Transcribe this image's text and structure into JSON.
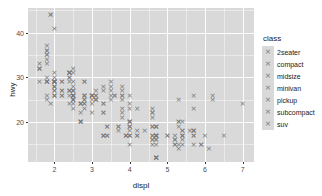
{
  "chart_data": {
    "type": "scatter",
    "title": "",
    "xlabel": "displ",
    "ylabel": "hwy",
    "xlim": [
      1.3,
      7.3
    ],
    "ylim": [
      11,
      45.5
    ],
    "xticks": [
      2,
      3,
      4,
      5,
      6,
      7
    ],
    "yticks": [
      20,
      30,
      40
    ],
    "xtick_labels": [
      "2",
      "3",
      "4",
      "5",
      "6",
      "7"
    ],
    "ytick_labels": [
      "20",
      "30",
      "40"
    ],
    "x_minor_ticks": [
      1.5,
      2.5,
      3.5,
      4.5,
      5.5,
      6.5
    ],
    "y_minor_ticks": [
      15,
      25,
      35,
      45
    ],
    "grid": true,
    "panel_background": "#d9d9d9",
    "grid_color": "#ffffff",
    "point_color": "#777777",
    "point_shape": "cross",
    "legend": {
      "title": "class",
      "position": "right",
      "entries": [
        {
          "label": "2seater"
        },
        {
          "label": "compact"
        },
        {
          "label": "midsize"
        },
        {
          "label": "minivan"
        },
        {
          "label": "pickup"
        },
        {
          "label": "subcompact"
        },
        {
          "label": "suv"
        }
      ]
    },
    "x": [
      1.8,
      1.8,
      2.0,
      2.0,
      2.8,
      2.8,
      3.1,
      1.8,
      1.8,
      2.0,
      2.0,
      2.8,
      2.8,
      3.1,
      3.1,
      2.8,
      3.1,
      4.2,
      5.3,
      5.3,
      5.3,
      5.7,
      6.0,
      5.7,
      5.7,
      6.2,
      6.2,
      7.0,
      5.3,
      5.3,
      5.7,
      6.5,
      2.4,
      2.4,
      3.1,
      3.5,
      3.6,
      2.4,
      3.0,
      3.3,
      3.3,
      3.3,
      3.3,
      3.3,
      3.8,
      3.8,
      3.8,
      4.0,
      3.7,
      3.7,
      3.9,
      3.9,
      4.7,
      4.7,
      4.7,
      5.2,
      5.2,
      3.9,
      4.7,
      4.7,
      4.7,
      5.2,
      5.7,
      5.9,
      4.7,
      4.7,
      4.7,
      4.7,
      4.7,
      4.7,
      5.2,
      5.2,
      5.7,
      5.9,
      4.6,
      5.4,
      5.4,
      4.0,
      4.0,
      4.0,
      4.0,
      4.6,
      5.0,
      4.2,
      4.2,
      4.6,
      4.6,
      4.6,
      5.4,
      5.4,
      3.8,
      3.8,
      4.0,
      4.0,
      4.6,
      4.6,
      4.6,
      4.6,
      5.4,
      1.6,
      1.6,
      1.6,
      1.6,
      1.6,
      1.8,
      1.8,
      1.8,
      2.0,
      2.4,
      2.4,
      2.4,
      2.4,
      2.5,
      2.5,
      3.3,
      2.0,
      2.0,
      2.0,
      2.0,
      2.7,
      2.7,
      2.7,
      3.0,
      3.7,
      4.0,
      4.7,
      4.7,
      4.7,
      5.7,
      6.1,
      4.0,
      4.2,
      4.4,
      4.6,
      5.4,
      5.4,
      5.4,
      4.0,
      4.0,
      4.6,
      5.0,
      2.4,
      2.4,
      2.5,
      2.5,
      3.5,
      3.5,
      3.0,
      3.0,
      3.5,
      3.3,
      3.3,
      4.0,
      5.6,
      3.1,
      3.8,
      3.8,
      3.8,
      5.3,
      2.5,
      2.5,
      2.5,
      2.5,
      2.5,
      2.5,
      2.2,
      2.2,
      2.5,
      2.5,
      2.5,
      2.5,
      2.5,
      2.5,
      2.7,
      2.7,
      3.4,
      3.4,
      4.0,
      4.7,
      2.2,
      2.2,
      2.4,
      2.4,
      3.0,
      3.0,
      3.5,
      2.2,
      2.2,
      2.4,
      2.4,
      3.0,
      3.0,
      3.3,
      1.8,
      1.8,
      1.8,
      1.8,
      1.8,
      4.7,
      5.7,
      2.7,
      2.7,
      2.7,
      3.4,
      3.4,
      4.0,
      4.0,
      2.0,
      2.0,
      2.0,
      2.0,
      2.8,
      1.9,
      2.0,
      2.0,
      2.0,
      2.5,
      2.8,
      2.8,
      1.9,
      1.9,
      2.0,
      2.0,
      2.5,
      2.5,
      1.8,
      1.8,
      2.0,
      2.0,
      2.8,
      2.8,
      3.6
    ],
    "y": [
      29,
      29,
      31,
      30,
      26,
      26,
      27,
      26,
      25,
      28,
      27,
      25,
      25,
      25,
      25,
      24,
      25,
      23,
      20,
      15,
      20,
      17,
      17,
      26,
      23,
      26,
      25,
      24,
      19,
      14,
      15,
      17,
      27,
      30,
      26,
      29,
      26,
      24,
      24,
      22,
      22,
      24,
      24,
      17,
      22,
      21,
      23,
      23,
      19,
      18,
      17,
      17,
      19,
      19,
      12,
      17,
      15,
      17,
      17,
      12,
      17,
      16,
      18,
      15,
      16,
      12,
      17,
      17,
      16,
      12,
      15,
      16,
      17,
      15,
      17,
      17,
      18,
      17,
      19,
      17,
      19,
      19,
      17,
      17,
      17,
      16,
      16,
      17,
      15,
      17,
      26,
      25,
      26,
      24,
      21,
      22,
      23,
      22,
      20,
      33,
      32,
      32,
      29,
      32,
      34,
      36,
      36,
      29,
      26,
      27,
      30,
      31,
      26,
      26,
      28,
      26,
      29,
      28,
      27,
      24,
      24,
      24,
      22,
      19,
      20,
      17,
      12,
      19,
      18,
      14,
      15,
      18,
      18,
      15,
      17,
      16,
      18,
      17,
      19,
      19,
      17,
      29,
      27,
      31,
      32,
      27,
      26,
      26,
      25,
      25,
      17,
      17,
      20,
      18,
      26,
      26,
      27,
      28,
      25,
      25,
      24,
      27,
      25,
      26,
      23,
      26,
      26,
      26,
      26,
      25,
      27,
      25,
      27,
      20,
      20,
      19,
      17,
      20,
      17,
      29,
      27,
      31,
      31,
      26,
      26,
      28,
      27,
      29,
      31,
      31,
      26,
      26,
      27,
      30,
      33,
      35,
      37,
      35,
      15,
      18,
      20,
      20,
      22,
      17,
      19,
      18,
      20,
      29,
      26,
      29,
      29,
      24,
      44,
      29,
      26,
      29,
      29,
      29,
      23,
      24,
      44,
      41,
      29,
      26,
      28,
      29,
      29,
      29,
      28,
      29,
      26,
      26,
      26
    ]
  }
}
